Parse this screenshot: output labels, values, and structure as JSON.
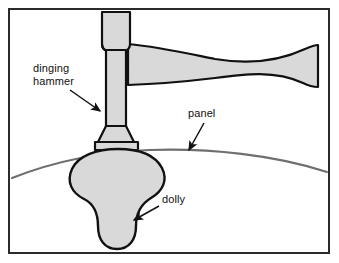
{
  "figure": {
    "background_color": "#ffffff",
    "frame": {
      "name": "figure-border",
      "stroke_color": "#2b2b2b",
      "stroke_width": 2,
      "x": 8,
      "y": 8,
      "width": 322,
      "height": 246
    },
    "style": {
      "metal_fill": "#d9d9d9",
      "outline_color": "#111111",
      "panel_color": "#6f6f6f",
      "leader_color": "#111111",
      "text_color": "#111111"
    }
  },
  "labels": [
    {
      "id": "dinging-hammer",
      "lines": [
        "dinging",
        "hammer"
      ],
      "line1": "dinging",
      "line2": "hammer",
      "x": 33,
      "y": 72,
      "arrow_from": [
        70,
        90
      ],
      "arrow_to": [
        101,
        112
      ]
    },
    {
      "id": "panel",
      "lines": [
        "panel"
      ],
      "line1": "panel",
      "x": 188,
      "y": 117,
      "arrow_from": [
        203,
        124
      ],
      "arrow_to": [
        188,
        152
      ]
    },
    {
      "id": "dolly",
      "lines": [
        "dolly"
      ],
      "line1": "dolly",
      "x": 162,
      "y": 203,
      "arrow_from": [
        159,
        207
      ],
      "arrow_to": [
        133,
        221
      ]
    }
  ],
  "parts": [
    {
      "id": "hammer-handle",
      "name": "dinging-hammer-handle",
      "description": "tapered hourglass handle extending right to frame edge"
    },
    {
      "id": "hammer-shaft",
      "name": "dinging-hammer-shaft",
      "description": "vertical neck below the head"
    },
    {
      "id": "hammer-face",
      "name": "dinging-hammer-face",
      "description": "flared collar and flat striking face"
    },
    {
      "id": "panel-curve",
      "name": "sheet-metal-panel",
      "description": "thin curved sheet metal line across the figure"
    },
    {
      "id": "dolly-body",
      "name": "dolly-body",
      "description": "mushroom shaped dolly held beneath the panel"
    }
  ]
}
